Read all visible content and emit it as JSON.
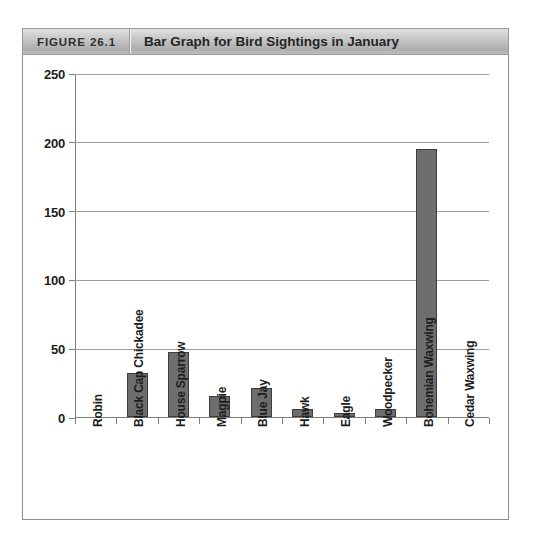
{
  "figure": {
    "number_label": "FIGURE 26.1",
    "title": "Bar Graph for Bird Sightings in January"
  },
  "colors": {
    "bar_fill": "#6e6e6e",
    "bar_stroke": "#3d3d3d",
    "axis": "#7d7d7d",
    "gridline": "#9d9d9d",
    "header_text": "#252525",
    "frame": "#8c8c8c"
  },
  "chart_data": {
    "type": "bar",
    "title": "Bar Graph for Bird Sightings in January",
    "xlabel": "",
    "ylabel": "",
    "ylim": [
      0,
      250
    ],
    "yticks": [
      0,
      50,
      100,
      150,
      200,
      250
    ],
    "ytick_labels": [
      "0",
      "50",
      "100",
      "150",
      "200",
      "250"
    ],
    "grid": true,
    "legend": "none",
    "categories": [
      "Robin",
      "Black Cap Chickadee",
      "House Sparrow",
      "Magpie",
      "Blue Jay",
      "Hawk",
      "Eagle",
      "Woodpecker",
      "Bohemian Waxwing",
      "Cedar Waxwing"
    ],
    "values": [
      0,
      32,
      47,
      15,
      21,
      6,
      3,
      6,
      195,
      0
    ]
  }
}
